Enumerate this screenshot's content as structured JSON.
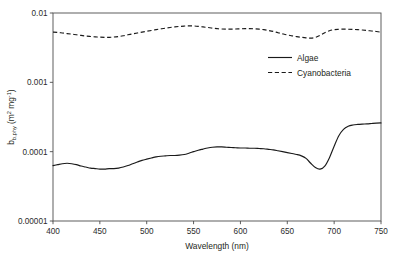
{
  "chart_data": {
    "type": "line",
    "title": "",
    "xlabel": "Wavelength (nm)",
    "ylabel_parts": {
      "base": "b",
      "subscript": "b,phy",
      "units_open": " (m",
      "units_sup1": "2",
      "units_mid": " mg",
      "units_sup2": "-1",
      "units_close": ")"
    },
    "ylabel": "b b,phy (m2 mg-1)",
    "xlim": [
      400,
      750
    ],
    "ylim": [
      1e-05,
      0.01
    ],
    "yscale": "log",
    "xscale": "linear",
    "grid": false,
    "legend_position": "upper-right-inside",
    "xticks": [
      400,
      450,
      500,
      550,
      600,
      650,
      700,
      750
    ],
    "xtick_labels": [
      "400",
      "450",
      "500",
      "550",
      "600",
      "650",
      "700",
      "750"
    ],
    "yticks": [
      0.01,
      0.001,
      0.0001,
      1e-05
    ],
    "ytick_labels": [
      "0.01",
      "0.001",
      "0.0001",
      "0.00001"
    ],
    "series": [
      {
        "name": "Algae",
        "style": "solid",
        "color": "#1a1a1a",
        "x": [
          400,
          405,
          410,
          415,
          420,
          425,
          430,
          435,
          440,
          445,
          450,
          455,
          460,
          465,
          470,
          475,
          480,
          485,
          490,
          495,
          500,
          505,
          510,
          515,
          520,
          525,
          530,
          535,
          540,
          545,
          550,
          555,
          560,
          565,
          570,
          575,
          580,
          585,
          590,
          595,
          600,
          605,
          610,
          615,
          620,
          625,
          630,
          635,
          640,
          645,
          650,
          655,
          660,
          665,
          670,
          675,
          680,
          685,
          690,
          695,
          700,
          705,
          710,
          715,
          720,
          725,
          730,
          735,
          740,
          745,
          750
        ],
        "values": [
          6.3e-05,
          6.5e-05,
          6.7e-05,
          6.8e-05,
          6.7e-05,
          6.5e-05,
          6.2e-05,
          6e-05,
          5.8e-05,
          5.7e-05,
          5.6e-05,
          5.6e-05,
          5.7e-05,
          5.7e-05,
          5.8e-05,
          6e-05,
          6.3e-05,
          6.7e-05,
          7.1e-05,
          7.5e-05,
          7.8e-05,
          8.1e-05,
          8.4e-05,
          8.6e-05,
          8.7e-05,
          8.8e-05,
          8.8e-05,
          8.9e-05,
          9.1e-05,
          9.5e-05,
          0.0001,
          0.000105,
          0.000109,
          0.000113,
          0.000116,
          0.000117,
          0.000117,
          0.000116,
          0.000115,
          0.000114,
          0.000113,
          0.000113,
          0.000112,
          0.000112,
          0.000111,
          0.00011,
          0.000108,
          0.000106,
          0.000103,
          0.0001,
          9.7e-05,
          9.4e-05,
          9.1e-05,
          8.7e-05,
          8e-05,
          6.8e-05,
          5.9e-05,
          5.6e-05,
          6.2e-05,
          8.2e-05,
          0.00012,
          0.00017,
          0.00021,
          0.000232,
          0.000242,
          0.000247,
          0.00025,
          0.000252,
          0.000255,
          0.000258,
          0.00026
        ]
      },
      {
        "name": "Cyanobacteria",
        "style": "dashed",
        "color": "#1a1a1a",
        "x": [
          400,
          405,
          410,
          415,
          420,
          425,
          430,
          435,
          440,
          445,
          450,
          455,
          460,
          465,
          470,
          475,
          480,
          485,
          490,
          495,
          500,
          505,
          510,
          515,
          520,
          525,
          530,
          535,
          540,
          545,
          550,
          555,
          560,
          565,
          570,
          575,
          580,
          585,
          590,
          595,
          600,
          605,
          610,
          615,
          620,
          625,
          630,
          635,
          640,
          645,
          650,
          655,
          660,
          665,
          670,
          675,
          680,
          685,
          690,
          695,
          700,
          705,
          710,
          715,
          720,
          725,
          730,
          735,
          740,
          745,
          750
        ],
        "values": [
          0.0053,
          0.00525,
          0.00515,
          0.00505,
          0.00495,
          0.00485,
          0.00475,
          0.00465,
          0.00458,
          0.00452,
          0.00448,
          0.00446,
          0.00446,
          0.0045,
          0.00458,
          0.0047,
          0.00485,
          0.005,
          0.00515,
          0.0053,
          0.00545,
          0.0056,
          0.00575,
          0.0059,
          0.00605,
          0.00618,
          0.0063,
          0.0064,
          0.00648,
          0.00652,
          0.0065,
          0.00642,
          0.0063,
          0.00618,
          0.00605,
          0.00595,
          0.00588,
          0.00585,
          0.00585,
          0.00588,
          0.00592,
          0.00595,
          0.00595,
          0.00592,
          0.00585,
          0.00575,
          0.0056,
          0.00542,
          0.0052,
          0.005,
          0.00482,
          0.00468,
          0.00456,
          0.00446,
          0.00438,
          0.00435,
          0.00445,
          0.00475,
          0.0052,
          0.00555,
          0.00575,
          0.00582,
          0.00585,
          0.00584,
          0.0058,
          0.00575,
          0.00568,
          0.0056,
          0.0055,
          0.0054,
          0.0053
        ]
      }
    ],
    "legend": [
      {
        "label": "Algae",
        "style": "solid"
      },
      {
        "label": "Cyanobacteria",
        "style": "dashed"
      }
    ]
  }
}
